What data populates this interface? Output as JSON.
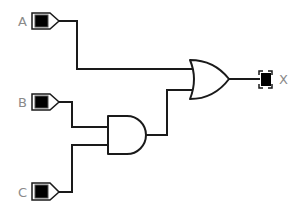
{
  "diagram": {
    "type": "logic-circuit",
    "inputs": [
      {
        "id": "A",
        "label": "A"
      },
      {
        "id": "B",
        "label": "B"
      },
      {
        "id": "C",
        "label": "C"
      }
    ],
    "gates": [
      {
        "id": "and1",
        "type": "AND",
        "inputs": [
          "B",
          "C"
        ]
      },
      {
        "id": "or1",
        "type": "OR",
        "inputs": [
          "A",
          "and1"
        ]
      }
    ],
    "outputs": [
      {
        "id": "X",
        "label": "X",
        "source": "or1"
      }
    ],
    "expression": "X = A + (B · C)"
  }
}
